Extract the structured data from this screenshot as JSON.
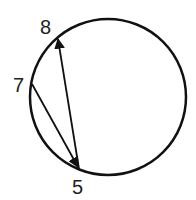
{
  "diagram": {
    "circle": {
      "cx": 108,
      "cy": 97,
      "r": 78,
      "stroke": "#111111"
    },
    "points": [
      {
        "id": "8",
        "label": "8",
        "x": 58,
        "y": 37,
        "lx": 48,
        "ly": 34
      },
      {
        "id": "7",
        "label": "7",
        "x": 32,
        "y": 84,
        "lx": 21,
        "ly": 91
      },
      {
        "id": "5",
        "label": "5",
        "x": 79,
        "y": 169,
        "lx": 79,
        "ly": 193
      }
    ],
    "arrows": [
      {
        "from": "5",
        "to": "8"
      },
      {
        "from": "7",
        "to": "5"
      }
    ]
  }
}
